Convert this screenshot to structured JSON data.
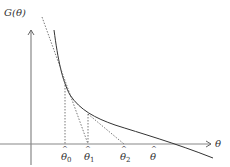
{
  "diagram": {
    "y_axis_label": "G(θ)",
    "x_axis_label": "θ",
    "x_ticks": [
      {
        "symbol": "θ",
        "hat": true,
        "sub": "0"
      },
      {
        "symbol": "θ",
        "hat": true,
        "sub": "1"
      },
      {
        "symbol": "θ",
        "hat": true,
        "sub": "2"
      },
      {
        "symbol": "θ",
        "hat": true,
        "sub": ""
      }
    ],
    "colors": {
      "curve": "#333333",
      "axis": "#888888",
      "tangent": "#555555"
    }
  }
}
